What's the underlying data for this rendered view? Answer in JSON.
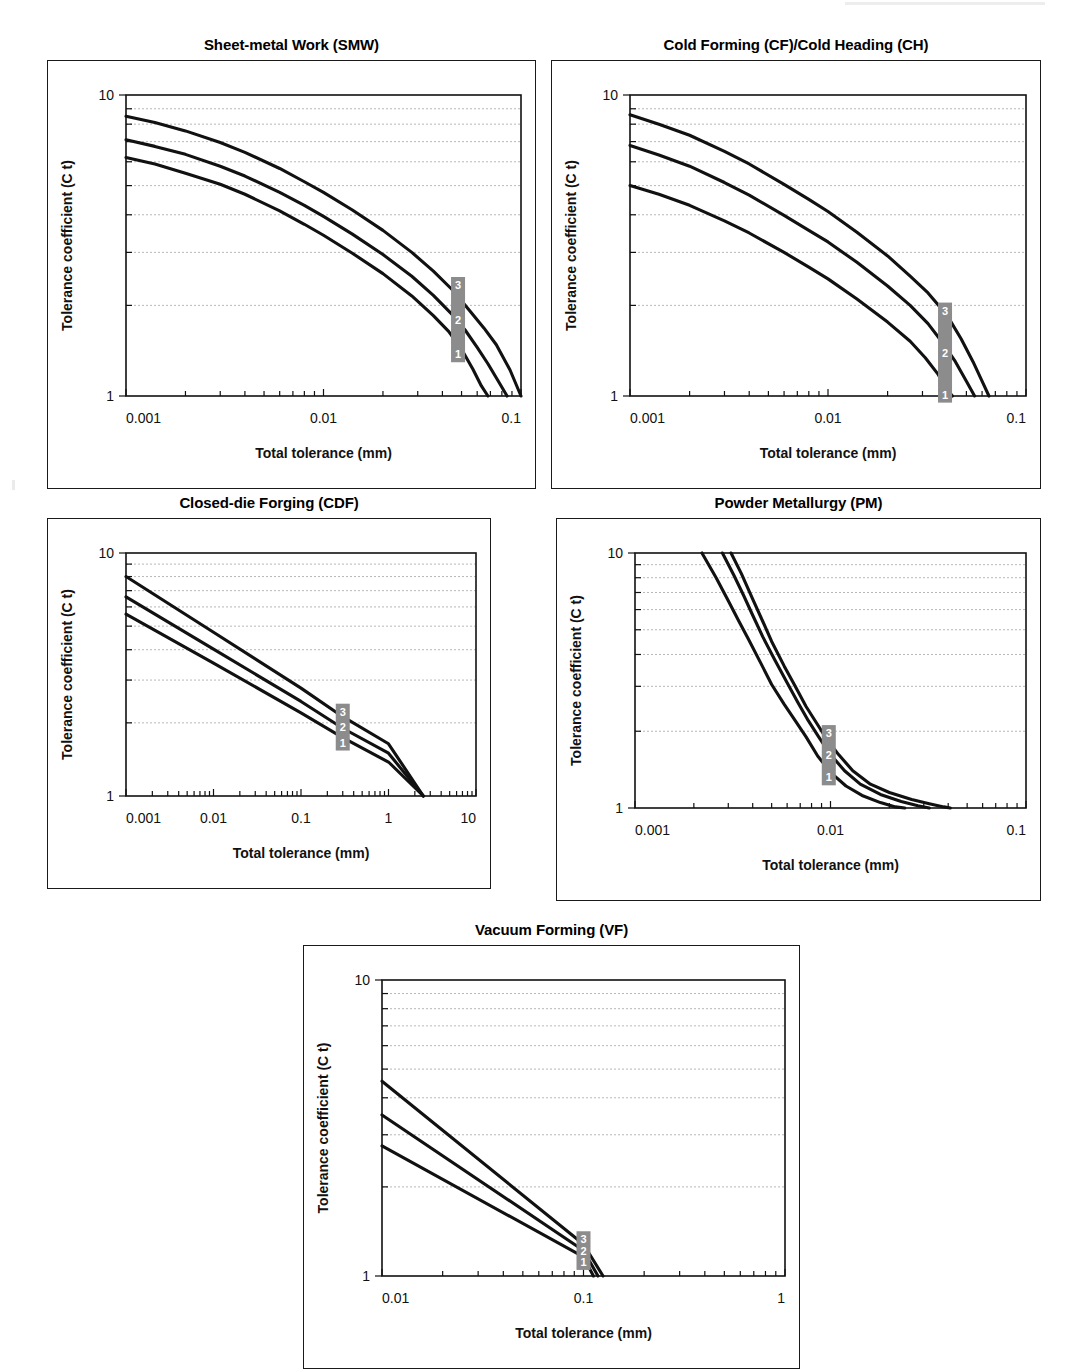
{
  "figure": {
    "axis_titles": {
      "x": "Total tolerance (mm)",
      "y": "Tolerance coefficient (C  t)"
    },
    "series_labels": [
      "3",
      "2",
      "1"
    ]
  },
  "chart_data": [
    {
      "id": "smw",
      "type": "line",
      "title": "Sheet-metal Work (SMW)",
      "xlabel": "Total tolerance (mm)",
      "ylabel": "Tolerance coefficient (C  t)",
      "xscale": "log",
      "yscale": "log",
      "xlim": [
        0.001,
        0.1
      ],
      "ylim": [
        1,
        10
      ],
      "xticks": [
        0.001,
        0.01,
        0.1
      ],
      "xticklabels": [
        "0.001",
        "0.01",
        "0.1"
      ],
      "yticks": [
        1,
        10
      ],
      "yticklabels": [
        "1",
        "10"
      ],
      "grid": "horizontal-minor",
      "legend": "inline-labels",
      "marker_x": 0.048,
      "series": [
        {
          "name": "3",
          "x": [
            0.001,
            0.0014,
            0.002,
            0.003,
            0.004,
            0.006,
            0.008,
            0.01,
            0.014,
            0.02,
            0.028,
            0.036,
            0.045,
            0.055,
            0.065,
            0.075,
            0.088,
            0.1
          ],
          "y": [
            8.5,
            8.1,
            7.6,
            6.95,
            6.45,
            5.7,
            5.15,
            4.75,
            4.15,
            3.55,
            3.0,
            2.6,
            2.25,
            1.92,
            1.68,
            1.48,
            1.22,
            1.0
          ]
        },
        {
          "name": "2",
          "x": [
            0.001,
            0.0014,
            0.002,
            0.003,
            0.004,
            0.006,
            0.008,
            0.01,
            0.014,
            0.02,
            0.028,
            0.036,
            0.045,
            0.052,
            0.06,
            0.068,
            0.078,
            0.085
          ],
          "y": [
            7.1,
            6.75,
            6.35,
            5.8,
            5.38,
            4.75,
            4.3,
            3.95,
            3.45,
            2.95,
            2.5,
            2.16,
            1.86,
            1.66,
            1.45,
            1.28,
            1.1,
            1.0
          ]
        },
        {
          "name": "1",
          "x": [
            0.001,
            0.0014,
            0.002,
            0.003,
            0.004,
            0.006,
            0.008,
            0.01,
            0.014,
            0.02,
            0.028,
            0.036,
            0.043,
            0.05,
            0.057,
            0.063,
            0.068
          ],
          "y": [
            6.2,
            5.9,
            5.5,
            5.05,
            4.68,
            4.12,
            3.72,
            3.42,
            2.98,
            2.55,
            2.15,
            1.85,
            1.64,
            1.43,
            1.23,
            1.08,
            1.0
          ]
        }
      ]
    },
    {
      "id": "cf_ch",
      "type": "line",
      "title": "Cold Forming (CF)/Cold Heading (CH)",
      "xlabel": "Total tolerance (mm)",
      "ylabel": "Tolerance coefficient (C  t)",
      "xscale": "log",
      "yscale": "log",
      "xlim": [
        0.001,
        0.1
      ],
      "ylim": [
        1,
        10
      ],
      "xticks": [
        0.001,
        0.01,
        0.1
      ],
      "xticklabels": [
        "0.001",
        "0.01",
        "0.1"
      ],
      "yticks": [
        1,
        10
      ],
      "yticklabels": [
        "1",
        "10"
      ],
      "grid": "horizontal-minor",
      "legend": "inline-labels",
      "marker_x": 0.039,
      "series": [
        {
          "name": "3",
          "x": [
            0.001,
            0.0014,
            0.002,
            0.003,
            0.004,
            0.006,
            0.008,
            0.01,
            0.014,
            0.02,
            0.026,
            0.032,
            0.04,
            0.047,
            0.054,
            0.06,
            0.065
          ],
          "y": [
            8.6,
            8.0,
            7.35,
            6.5,
            5.9,
            5.05,
            4.5,
            4.1,
            3.5,
            2.92,
            2.5,
            2.2,
            1.85,
            1.55,
            1.3,
            1.12,
            1.0
          ]
        },
        {
          "name": "2",
          "x": [
            0.001,
            0.0014,
            0.002,
            0.003,
            0.004,
            0.006,
            0.008,
            0.01,
            0.014,
            0.02,
            0.026,
            0.032,
            0.038,
            0.044,
            0.05,
            0.055
          ],
          "y": [
            6.8,
            6.32,
            5.8,
            5.12,
            4.65,
            3.98,
            3.55,
            3.25,
            2.78,
            2.32,
            2.0,
            1.74,
            1.5,
            1.3,
            1.12,
            1.0
          ]
        },
        {
          "name": "1",
          "x": [
            0.001,
            0.0014,
            0.002,
            0.003,
            0.004,
            0.006,
            0.008,
            0.01,
            0.014,
            0.02,
            0.026,
            0.031,
            0.036,
            0.04,
            0.0425
          ],
          "y": [
            5.0,
            4.68,
            4.3,
            3.82,
            3.48,
            3.0,
            2.68,
            2.45,
            2.1,
            1.76,
            1.52,
            1.34,
            1.18,
            1.05,
            1.0
          ]
        }
      ]
    },
    {
      "id": "cdf",
      "type": "line",
      "title": "Closed-die Forging (CDF)",
      "xlabel": "Total tolerance (mm)",
      "ylabel": "Tolerance coefficient (C  t)",
      "xscale": "log",
      "yscale": "log",
      "xlim": [
        0.001,
        10
      ],
      "ylim": [
        1,
        10
      ],
      "xticks": [
        0.001,
        0.01,
        0.1,
        1,
        10
      ],
      "xticklabels": [
        "0.001",
        "0.01",
        "0.1",
        "1",
        "10"
      ],
      "yticks": [
        1,
        10
      ],
      "yticklabels": [
        "1",
        "10"
      ],
      "grid": "horizontal-minor",
      "legend": "inline-labels",
      "marker_x": 0.3,
      "series": [
        {
          "name": "3",
          "x": [
            0.001,
            0.01,
            0.1,
            0.3,
            1,
            2.5
          ],
          "y": [
            8.0,
            4.72,
            2.78,
            2.12,
            1.64,
            1.0
          ]
        },
        {
          "name": "2",
          "x": [
            0.001,
            0.01,
            0.1,
            0.3,
            1,
            2.5
          ],
          "y": [
            6.6,
            4.02,
            2.45,
            1.9,
            1.5,
            1.0
          ]
        },
        {
          "name": "1",
          "x": [
            0.001,
            0.01,
            0.1,
            0.3,
            1,
            2.5
          ],
          "y": [
            5.6,
            3.52,
            2.2,
            1.74,
            1.38,
            1.0
          ]
        }
      ]
    },
    {
      "id": "pm",
      "type": "line",
      "title": "Powder Metallurgy (PM)",
      "xlabel": "Total tolerance (mm)",
      "ylabel": "Tolerance coefficient (C  t)",
      "xscale": "log",
      "yscale": "log",
      "xlim": [
        0.001,
        0.1
      ],
      "ylim": [
        1,
        10
      ],
      "xticks": [
        0.001,
        0.01,
        0.1
      ],
      "xticklabels": [
        "0.001",
        "0.01",
        "0.1"
      ],
      "yticks": [
        1,
        10
      ],
      "yticklabels": [
        "1",
        "10"
      ],
      "grid": "horizontal-minor",
      "legend": "inline-labels",
      "marker_x": 0.0098,
      "series": [
        {
          "name": "3",
          "x": [
            0.0031,
            0.0035,
            0.004,
            0.0045,
            0.005,
            0.0058,
            0.0066,
            0.0075,
            0.0085,
            0.0095,
            0.011,
            0.013,
            0.016,
            0.02,
            0.026,
            0.032,
            0.038,
            0.041
          ],
          "y": [
            10.0,
            8.3,
            6.6,
            5.4,
            4.5,
            3.6,
            3.0,
            2.5,
            2.15,
            1.88,
            1.62,
            1.4,
            1.24,
            1.15,
            1.08,
            1.04,
            1.01,
            1.0
          ]
        },
        {
          "name": "2",
          "x": [
            0.0028,
            0.0032,
            0.0036,
            0.004,
            0.0045,
            0.0052,
            0.006,
            0.0068,
            0.0077,
            0.0087,
            0.01,
            0.0118,
            0.0142,
            0.018,
            0.023,
            0.028,
            0.032
          ],
          "y": [
            10.0,
            8.2,
            6.8,
            5.7,
            4.7,
            3.8,
            3.1,
            2.6,
            2.2,
            1.9,
            1.62,
            1.4,
            1.24,
            1.13,
            1.06,
            1.02,
            1.0
          ]
        },
        {
          "name": "1",
          "x": [
            0.0022,
            0.0026,
            0.003,
            0.0034,
            0.0038,
            0.0044,
            0.005,
            0.0058,
            0.0066,
            0.0075,
            0.0086,
            0.01,
            0.012,
            0.0145,
            0.018,
            0.0215,
            0.024
          ],
          "y": [
            10.0,
            8.0,
            6.5,
            5.4,
            4.6,
            3.7,
            3.05,
            2.55,
            2.2,
            1.9,
            1.6,
            1.38,
            1.22,
            1.12,
            1.05,
            1.01,
            1.0
          ]
        }
      ]
    },
    {
      "id": "vf",
      "type": "line",
      "title": "Vacuum Forming (VF)",
      "xlabel": "Total tolerance (mm)",
      "ylabel": "Tolerance coefficient (C  t)",
      "xscale": "log",
      "yscale": "log",
      "xlim": [
        0.01,
        1
      ],
      "ylim": [
        1,
        10
      ],
      "xticks": [
        0.01,
        0.1,
        1
      ],
      "xticklabels": [
        "0.01",
        "0.1",
        "1"
      ],
      "yticks": [
        1,
        10
      ],
      "yticklabels": [
        "1",
        "10"
      ],
      "grid": "horizontal-minor",
      "legend": "inline-labels",
      "marker_x": 0.1,
      "series": [
        {
          "name": "3",
          "x": [
            0.01,
            0.1,
            0.125
          ],
          "y": [
            4.55,
            1.28,
            1.0
          ]
        },
        {
          "name": "2",
          "x": [
            0.01,
            0.1,
            0.118
          ],
          "y": [
            3.5,
            1.22,
            1.0
          ]
        },
        {
          "name": "1",
          "x": [
            0.01,
            0.1,
            0.112
          ],
          "y": [
            2.75,
            1.16,
            1.0
          ]
        }
      ]
    }
  ]
}
